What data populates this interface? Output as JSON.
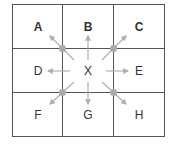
{
  "diagram": {
    "type": "3x3 grid neighborhood",
    "cells": [
      {
        "label": "A",
        "row": 0,
        "col": 0
      },
      {
        "label": "B",
        "row": 0,
        "col": 1
      },
      {
        "label": "C",
        "row": 0,
        "col": 2
      },
      {
        "label": "D",
        "row": 1,
        "col": 0
      },
      {
        "label": "X",
        "row": 1,
        "col": 1
      },
      {
        "label": "E",
        "row": 1,
        "col": 2
      },
      {
        "label": "F",
        "row": 2,
        "col": 0
      },
      {
        "label": "G",
        "row": 2,
        "col": 1
      },
      {
        "label": "H",
        "row": 2,
        "col": 2
      }
    ],
    "center": "X",
    "arrows_from_center_to": [
      "A",
      "B",
      "C",
      "D",
      "E",
      "F",
      "G",
      "H"
    ],
    "corner_dots": 4,
    "colors": {
      "grid_line": "#555555",
      "arrow": "#b0b0b0",
      "dot": "#aaaaaa",
      "text": "#333333"
    }
  }
}
